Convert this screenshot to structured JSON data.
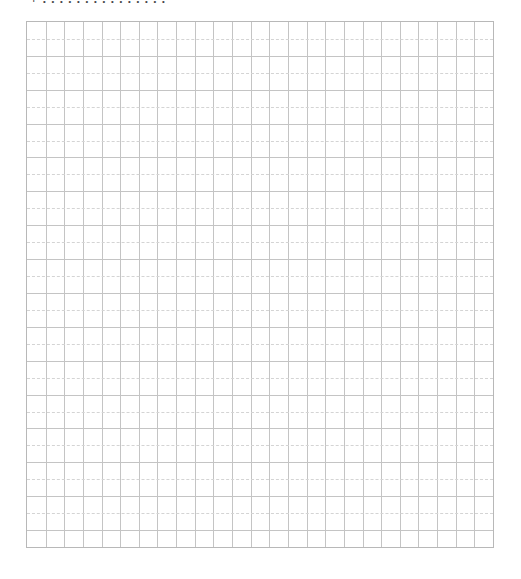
{
  "page": {
    "title": "+ . . . . . . . . . . . . . . .",
    "grid": {
      "columns": 25,
      "rows": 31,
      "line_color": "#c4c4c4",
      "dashed_color": "#d4d4d4",
      "border_color": "#b8b8b8",
      "pattern": "alternating-solid-dashed-rows"
    }
  }
}
